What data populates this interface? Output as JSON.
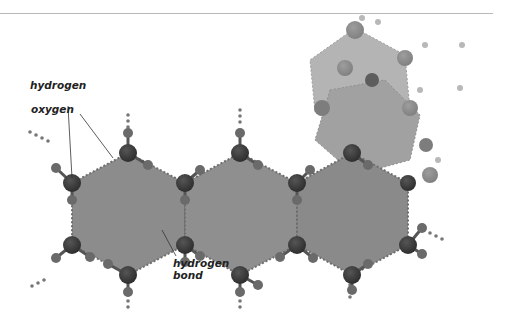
{
  "diagram": {
    "labels": {
      "hydrogen": "hydrogen",
      "oxygen": "oxygen",
      "hydrogen_bond_line1": "hydrogen",
      "hydrogen_bond_line2": "bond"
    },
    "colors": {
      "hex_fill_main": "#8c8c8c",
      "hex_fill_back": "#a8a8a8",
      "oxygen": "#3a3a3a",
      "hydrogen": "#6a6a6a",
      "bond_dots": "#7a7a7a",
      "top_rule": "#b8b8b8"
    }
  }
}
